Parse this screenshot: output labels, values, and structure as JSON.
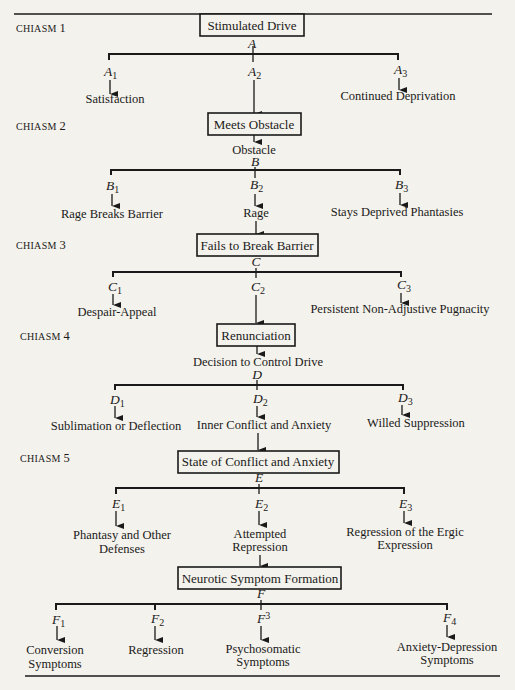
{
  "diagram": {
    "chiasms": [
      {
        "label": "CHIASM",
        "number": "1"
      },
      {
        "label": "CHIASM",
        "number": "2"
      },
      {
        "label": "CHIASM",
        "number": "3"
      },
      {
        "label": "CHIASM",
        "number": "4"
      },
      {
        "label": "CHIASM",
        "number": "5"
      }
    ],
    "nodes": {
      "stimulated_drive": "Stimulated Drive",
      "A": "A",
      "A1": "A",
      "A1_sub": "1",
      "A2": "A",
      "A2_sub": "2",
      "A3": "A",
      "A3_sub": "3",
      "satisfaction": "Satisfaction",
      "continued_deprivation": "Continued Deprivation",
      "meets_obstacle": "Meets Obstacle",
      "obstacle": "Obstacle",
      "B": "B",
      "B1": "B",
      "B1_sub": "1",
      "B2": "B",
      "B2_sub": "2",
      "B3": "B",
      "B3_sub": "3",
      "rage_breaks_barrier": "Rage Breaks Barrier",
      "rage": "Rage",
      "stays_deprived": "Stays Deprived Phantasies",
      "fails_to_break": "Fails to Break Barrier",
      "C": "C",
      "C1": "C",
      "C1_sub": "1",
      "C2": "C",
      "C2_sub": "2",
      "C3": "C",
      "C3_sub": "3",
      "despair_appeal": "Despair-Appeal",
      "persistent": "Persistent Non-Adjustive Pugnacity",
      "renunciation": "Renunciation",
      "decision": "Decision to Control Drive",
      "D": "D",
      "D1": "D",
      "D1_sub": "1",
      "D2": "D",
      "D2_sub": "2",
      "D3": "D",
      "D3_sub": "3",
      "sublimation": "Sublimation or Deflection",
      "inner_conflict": "Inner Conflict and Anxiety",
      "willed_suppression": "Willed Suppression",
      "state_of_conflict": "State of Conflict and Anxiety",
      "E": "E",
      "E1": "E",
      "E1_sub": "1",
      "E2": "E",
      "E2_sub": "2",
      "E3": "E",
      "E3_sub": "3",
      "phantasy_1": "Phantasy and Other",
      "phantasy_2": "Defenses",
      "attempted_1": "Attempted",
      "attempted_2": "Repression",
      "regression_ergic_1": "Regression of the Ergic",
      "regression_ergic_2": "Expression",
      "neurotic": "Neurotic Symptom Formation",
      "F": "F",
      "F1": "F",
      "F1_sub": "1",
      "F2": "F",
      "F2_sub": "2",
      "F3": "F",
      "F3_sub": "3",
      "F4": "F",
      "F4_sub": "4",
      "conversion_1": "Conversion",
      "conversion_2": "Symptoms",
      "regression": "Regression",
      "psychosomatic_1": "Psychosomatic",
      "psychosomatic_2": "Symptoms",
      "anxiety_dep_1": "Anxiety-Depression",
      "anxiety_dep_2": "Symptoms"
    }
  }
}
